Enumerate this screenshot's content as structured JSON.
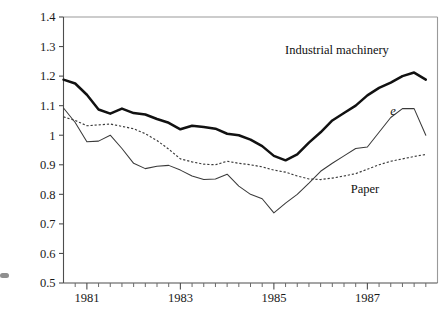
{
  "chart_data": {
    "type": "line",
    "title": "",
    "xlabel": "",
    "ylabel": "",
    "ylim": [
      0.5,
      1.4
    ],
    "xlim": [
      1980.5,
      1988.5
    ],
    "grid": false,
    "legend": "inline-annotations",
    "ytick_labels": [
      "1.4",
      "1.3",
      "1.2",
      "1.1",
      "1",
      "0.9",
      "0.8",
      "0.7",
      "0.6",
      "0.5"
    ],
    "ytick_values": [
      1.4,
      1.3,
      1.2,
      1.1,
      1.0,
      0.9,
      0.8,
      0.7,
      0.6,
      0.5
    ],
    "xtick_labels": [
      "1981",
      "1983",
      "1985",
      "1987"
    ],
    "xtick_values": [
      1981,
      1983,
      1985,
      1987
    ],
    "x_minor_interval_years": 0.25,
    "x": [
      1980.5,
      1980.75,
      1981.0,
      1981.25,
      1981.5,
      1981.75,
      1982.0,
      1982.25,
      1982.5,
      1982.75,
      1983.0,
      1983.25,
      1983.5,
      1983.75,
      1984.0,
      1984.25,
      1984.5,
      1984.75,
      1985.0,
      1985.25,
      1985.5,
      1985.75,
      1986.0,
      1986.25,
      1986.5,
      1986.75,
      1987.0,
      1987.25,
      1987.5,
      1987.75,
      1988.0,
      1988.25
    ],
    "series": [
      {
        "name": "Industrial machinery",
        "style": "bold-solid",
        "color": "#111111",
        "label_x": 1986.35,
        "label_y": 1.275,
        "values": [
          1.188,
          1.175,
          1.137,
          1.087,
          1.073,
          1.09,
          1.075,
          1.07,
          1.055,
          1.042,
          1.02,
          1.032,
          1.028,
          1.022,
          1.005,
          1.0,
          0.985,
          0.963,
          0.93,
          0.915,
          0.935,
          0.975,
          1.01,
          1.05,
          1.075,
          1.1,
          1.135,
          1.16,
          1.178,
          1.2,
          1.212,
          1.188
        ]
      },
      {
        "name": "e",
        "style": "thin-solid",
        "color": "#3a3a3a",
        "label_x": 1987.55,
        "label_y": 1.068,
        "values": [
          1.092,
          1.043,
          0.978,
          0.98,
          1.0,
          0.955,
          0.905,
          0.887,
          0.895,
          0.898,
          0.882,
          0.862,
          0.85,
          0.852,
          0.868,
          0.828,
          0.8,
          0.785,
          0.737,
          0.77,
          0.8,
          0.838,
          0.878,
          0.905,
          0.93,
          0.955,
          0.96,
          1.01,
          1.06,
          1.09,
          1.09,
          1.0
        ]
      },
      {
        "name": "Paper",
        "style": "dotted",
        "color": "#3a3a3a",
        "label_x": 1986.95,
        "label_y": 0.805,
        "values": [
          1.062,
          1.05,
          1.032,
          1.035,
          1.038,
          1.03,
          1.022,
          1.005,
          0.982,
          0.953,
          0.92,
          0.91,
          0.902,
          0.9,
          0.912,
          0.905,
          0.9,
          0.893,
          0.882,
          0.875,
          0.862,
          0.852,
          0.85,
          0.855,
          0.862,
          0.87,
          0.885,
          0.9,
          0.912,
          0.92,
          0.928,
          0.935
        ]
      }
    ]
  },
  "axes": {
    "left_axis_name": "y-axis",
    "bottom_axis_name": "x-axis"
  }
}
